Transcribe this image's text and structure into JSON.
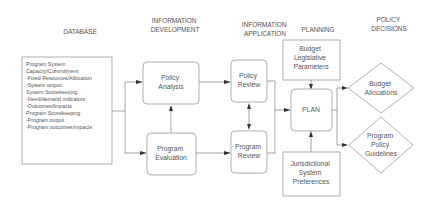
{
  "columns": [
    {
      "id": "database",
      "lines": [
        "DATABASE"
      ]
    },
    {
      "id": "information-development",
      "lines": [
        "INFORMATION",
        "DEVELOPMENT"
      ]
    },
    {
      "id": "information-application",
      "lines": [
        "INFORMATION",
        "APPLICATION"
      ]
    },
    {
      "id": "planning",
      "lines": [
        "PLANNING"
      ]
    },
    {
      "id": "policy-decisions",
      "lines": [
        "POLICY",
        "DECISIONS"
      ]
    }
  ],
  "database_box": {
    "lines": [
      "Program System",
      "",
      "Capacity/Commitment",
      "-Fixed Resources/Allocation",
      "-System output",
      "",
      "System Scorekeeping",
      "-Need/demand indicators",
      "-Outcomes/Impacts",
      "",
      "Program Scorekeeping",
      "-Program output",
      "-Program outcomes/impacts"
    ]
  },
  "nodes": {
    "policy_analysis": {
      "lines": [
        "Policy",
        "Analysis"
      ]
    },
    "program_evaluation": {
      "lines": [
        "Program",
        "Evaluation"
      ]
    },
    "policy_review": {
      "lines": [
        "Policy",
        "Review"
      ]
    },
    "program_review": {
      "lines": [
        "Program",
        "Review"
      ]
    },
    "budget_legislative": {
      "lines": [
        "Budget",
        "Legislative",
        "Parameters"
      ]
    },
    "plan": {
      "lines": [
        "PLAN"
      ]
    },
    "jurisdictional": {
      "lines": [
        "Jurisdictional",
        "System",
        "Preferences"
      ]
    },
    "budget_allocations": {
      "lines": [
        "Budget",
        "Allocations"
      ]
    },
    "program_policy_guidelines": {
      "lines": [
        "Program",
        "Policy",
        "Guidelines"
      ]
    }
  },
  "colors": {
    "line": "#8a8a8a",
    "text": "#555555",
    "arrowhead": "#333333",
    "background": "#ffffff"
  }
}
